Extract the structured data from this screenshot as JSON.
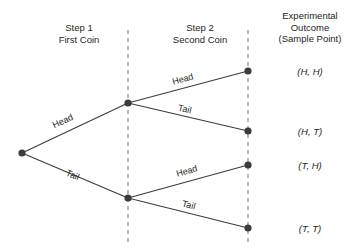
{
  "headers": {
    "step1": "Step 1\nFirst Coin",
    "step1_line1": "Step 1",
    "step1_line2": "First Coin",
    "step2_line1": "Step 2",
    "step2_line2": "Second Coin",
    "outcome_line1": "Experimental",
    "outcome_line2": "Outcome",
    "outcome_line3": "(Sample Point)"
  },
  "branch_labels": {
    "step1_head": "Head",
    "step1_tail": "Tail",
    "step2_head_from_head": "Head",
    "step2_tail_from_head": "Tail",
    "step2_head_from_tail": "Head",
    "step2_tail_from_tail": "Tail"
  },
  "outcomes": [
    {
      "id": "hh",
      "text": "(H, H)"
    },
    {
      "id": "ht",
      "text": "(H, T)"
    },
    {
      "id": "th",
      "text": "(T, H)"
    },
    {
      "id": "tt",
      "text": "(T, T)"
    }
  ],
  "colors": {
    "line": "#3b3b3b",
    "node": "#3b3b3b",
    "dashed_guide": "#8a8a8a",
    "text": "#231f20",
    "background": "#ffffff"
  },
  "geometry": {
    "root": {
      "x": 22,
      "y": 153
    },
    "step1_nodes": [
      {
        "id": "head",
        "x": 128,
        "y": 103
      },
      {
        "id": "tail",
        "x": 128,
        "y": 198
      }
    ],
    "terminal_nodes": [
      {
        "id": "hh",
        "x": 248,
        "y": 71
      },
      {
        "id": "ht",
        "x": 248,
        "y": 131
      },
      {
        "id": "th",
        "x": 248,
        "y": 165
      },
      {
        "id": "tt",
        "x": 248,
        "y": 228
      }
    ],
    "guides": [
      {
        "id": "guide-step1",
        "x": 128,
        "y_top": 30,
        "y_bottom": 245
      },
      {
        "id": "guide-step2",
        "x": 248,
        "y_top": 30,
        "y_bottom": 245
      }
    ]
  }
}
